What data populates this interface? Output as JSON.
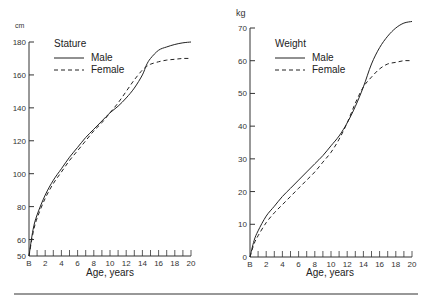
{
  "chart_data": [
    {
      "type": "line",
      "title": "Stature",
      "xlabel": "Age, years",
      "ylabel": "cm",
      "xlim": [
        0,
        20
      ],
      "ylim": [
        50,
        180
      ],
      "x_tick_labels": [
        "B",
        "2",
        "4",
        "6",
        "8",
        "10",
        "12",
        "14",
        "16",
        "18",
        "20"
      ],
      "y_ticks": [
        50,
        60,
        80,
        100,
        120,
        140,
        160,
        180
      ],
      "grid": false,
      "legend": {
        "title": "Stature",
        "position": "upper-left",
        "entries": [
          "Male",
          "Female"
        ]
      },
      "x": [
        0,
        0.5,
        1,
        2,
        3,
        4,
        5,
        6,
        7,
        8,
        9,
        10,
        11,
        12,
        13,
        14,
        14.5,
        15,
        16,
        17,
        18,
        19,
        20
      ],
      "series": [
        {
          "name": "Male",
          "style": "solid",
          "values": [
            50,
            66,
            75,
            87,
            96,
            103,
            110,
            116,
            122,
            127,
            132,
            137,
            141,
            146,
            152,
            160,
            166,
            170,
            175,
            177,
            178.5,
            179.5,
            180
          ]
        },
        {
          "name": "Female",
          "style": "dashed",
          "values": [
            50,
            64,
            73,
            85,
            94,
            101,
            108,
            114,
            120,
            126,
            131,
            137,
            143,
            150,
            157,
            163,
            165,
            166.5,
            168,
            169,
            169.5,
            170,
            170
          ]
        }
      ]
    },
    {
      "type": "line",
      "title": "Weight",
      "xlabel": "Age, years",
      "ylabel": "kg",
      "xlim": [
        0,
        20
      ],
      "ylim": [
        0,
        70
      ],
      "x_tick_labels": [
        "B",
        "2",
        "4",
        "6",
        "8",
        "10",
        "12",
        "14",
        "16",
        "18",
        "20"
      ],
      "y_ticks": [
        0,
        10,
        20,
        30,
        40,
        50,
        60,
        70
      ],
      "grid": false,
      "legend": {
        "title": "Weight",
        "position": "upper-left",
        "entries": [
          "Male",
          "Female"
        ]
      },
      "x": [
        0,
        0.5,
        1,
        2,
        3,
        4,
        5,
        6,
        7,
        8,
        9,
        10,
        11,
        12,
        13,
        14,
        15,
        16,
        17,
        18,
        19,
        20
      ],
      "series": [
        {
          "name": "Male",
          "style": "solid",
          "values": [
            0,
            5,
            8,
            12.5,
            15.5,
            18.5,
            21,
            23.5,
            26,
            28.5,
            31,
            34,
            37,
            41,
            46,
            52,
            59,
            64,
            67.5,
            70,
            71.5,
            72
          ]
        },
        {
          "name": "Female",
          "style": "dashed",
          "values": [
            0,
            4,
            6.5,
            10.5,
            13.5,
            16,
            18.5,
            21,
            23.5,
            26,
            29,
            32,
            36,
            41,
            47,
            52,
            55,
            57.5,
            59,
            59.5,
            60,
            60
          ]
        }
      ]
    }
  ],
  "panels": [
    {
      "unit": "cm",
      "legend_title": "Stature",
      "male_label": "Male",
      "female_label": "Female",
      "xlabel": "Age, years"
    },
    {
      "unit": "kg",
      "legend_title": "Weight",
      "male_label": "Male",
      "female_label": "Female",
      "xlabel": "Age, years"
    }
  ],
  "colors": {
    "line": "#222222",
    "axis": "#333333"
  }
}
